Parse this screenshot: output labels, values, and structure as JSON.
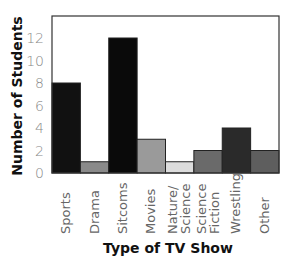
{
  "chart_data": {
    "type": "bar",
    "title": "",
    "xlabel": "Type of TV Show",
    "ylabel": "Number of Students",
    "ylim": [
      0,
      13
    ],
    "yticks": [
      "0",
      "2",
      "4",
      "6",
      "8",
      "10",
      "12"
    ],
    "grid": false,
    "legend": "none",
    "categories": [
      "Sports",
      "Drama",
      "Sitcoms",
      "Movies",
      "Nature/ Science",
      "Science Fiction",
      "Wrestling",
      "Other"
    ],
    "category_lines": [
      [
        "Sports"
      ],
      [
        "Drama"
      ],
      [
        "Sitcoms"
      ],
      [
        "Movies"
      ],
      [
        "Nature/",
        "Science"
      ],
      [
        "Science",
        "Fiction"
      ],
      [
        "Wrestling"
      ],
      [
        "Other"
      ]
    ],
    "values": [
      8,
      1,
      12,
      3,
      1,
      2,
      4,
      2
    ],
    "colors": [
      "#111111",
      "#8a8a8a",
      "#0a0a0a",
      "#9a9a9a",
      "#dcdcdc",
      "#6a6a6a",
      "#2a2a2a",
      "#5e5e5e"
    ]
  }
}
